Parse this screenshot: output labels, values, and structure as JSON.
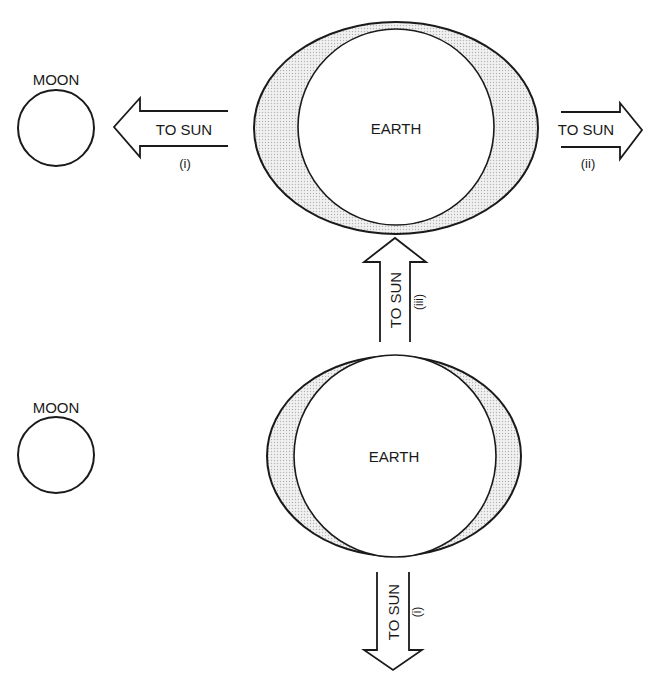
{
  "diagram": {
    "type": "tidal-bulge-diagram",
    "colors": {
      "stroke": "#1a1a1a",
      "bulge_fill": "#dcdcdc",
      "background": "#ffffff"
    },
    "top_panel": {
      "moon_label": "MOON",
      "earth_label": "EARTH",
      "arrows": [
        {
          "id": "left",
          "label": "TO SUN",
          "index": "(i)",
          "direction": "left"
        },
        {
          "id": "right",
          "label": "TO SUN",
          "index": "(ii)",
          "direction": "right"
        },
        {
          "id": "up",
          "label": "TO SUN",
          "index": "(iii)",
          "direction": "up"
        }
      ]
    },
    "bottom_panel": {
      "moon_label": "MOON",
      "earth_label": "EARTH",
      "arrows": [
        {
          "id": "down",
          "label": "TO SUN",
          "index": "(i)",
          "direction": "down"
        }
      ]
    }
  }
}
